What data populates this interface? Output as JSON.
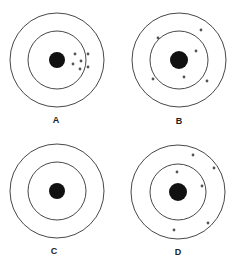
{
  "figure": {
    "colors": {
      "ring": "#333333",
      "bullseye": "#111111",
      "shot": "#555555",
      "background": "#ffffff"
    },
    "targets": [
      {
        "label": "A",
        "cx": 57,
        "cy": 60,
        "outer_r": 47,
        "inner_r": 29,
        "bull_r": 8,
        "label_pos": [
          56,
          123
        ],
        "shots": [
          [
            75,
            54
          ],
          [
            88,
            54
          ],
          [
            81,
            61
          ],
          [
            73,
            64
          ],
          [
            80,
            69
          ],
          [
            88,
            67
          ]
        ]
      },
      {
        "label": "B",
        "cx": 179,
        "cy": 60,
        "outer_r": 47,
        "inner_r": 29,
        "bull_r": 9,
        "label_pos": [
          179,
          124
        ],
        "shots": [
          [
            158,
            38
          ],
          [
            201,
            30
          ],
          [
            196,
            51
          ],
          [
            153,
            79
          ],
          [
            184,
            77
          ],
          [
            207,
            81
          ]
        ]
      },
      {
        "label": "C",
        "cx": 57,
        "cy": 191,
        "outer_r": 47,
        "inner_r": 29,
        "bull_r": 8,
        "label_pos": [
          54,
          254
        ],
        "shots": []
      },
      {
        "label": "D",
        "cx": 178,
        "cy": 192,
        "outer_r": 47,
        "inner_r": 28,
        "bull_r": 9,
        "label_pos": [
          178,
          255
        ],
        "shots": [
          [
            193,
            155
          ],
          [
            214,
            168
          ],
          [
            177,
            172
          ],
          [
            202,
            186
          ],
          [
            174,
            230
          ],
          [
            208,
            223
          ]
        ]
      }
    ]
  }
}
